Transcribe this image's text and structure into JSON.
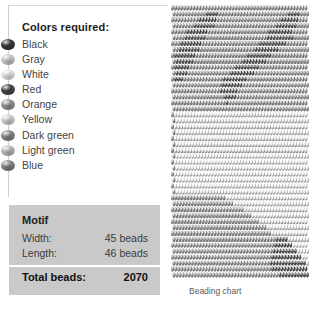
{
  "legend": {
    "title": "Colors required:",
    "items": [
      {
        "label": "Black",
        "swatch": "#3b3b3b"
      },
      {
        "label": "Gray",
        "swatch": "#d3d3d3"
      },
      {
        "label": "White",
        "swatch": "#f0f0f0"
      },
      {
        "label": "Red",
        "swatch": "#4a4a4a"
      },
      {
        "label": "Orange",
        "swatch": "#9b9b9b"
      },
      {
        "label": "Yellow",
        "swatch": "#dcdcdc"
      },
      {
        "label": "Dark green",
        "swatch": "#8d8d8d"
      },
      {
        "label": "Light green",
        "swatch": "#c4c4c4"
      },
      {
        "label": "Blue",
        "swatch": "#8a8a8a"
      }
    ]
  },
  "motif": {
    "heading": "Motif",
    "width_label": "Width:",
    "width_value": "45 beads",
    "length_label": "Length:",
    "length_value": "46 beads",
    "total_label": "Total beads:",
    "total_value": "2070",
    "box_color": "#c9c9c9"
  },
  "chart": {
    "caption": "Beading chart",
    "columns": 45,
    "rows": 46,
    "style": "brick-offset-rows",
    "palette": [
      "#3b3b3b",
      "#d3d3d3",
      "#f0f0f0",
      "#4a4a4a",
      "#9b9b9b",
      "#dcdcdc",
      "#8d8d8d",
      "#c4c4c4",
      "#8a8a8a"
    ],
    "bead_grid": [
      "888888888888888888888888888888888888888888888",
      "888888888880000888888888888888888888880000888",
      "888888888000000888888888888888888888000000888",
      "888888800000008888888888888888888800000008888",
      "888880000000888888888888888888880000000088888",
      "888800000008888888888888888888800000000088888",
      "888000000088888888888888888880000000008888888",
      "880000000888888888888888888000000008888888888",
      "800000008888888888888888800000000888888888888",
      "800000088888888888888880000000088888888888888",
      "800000888888888888888000000008888888888888888",
      "800008888888888888800000000888888888888888888",
      "800088888888888880000000088888888888888888888",
      "888888888888888800000008888888888888888888888",
      "888888888888888800000088888888888888888888888",
      "888888888888888880000888888888888888888888888",
      "888888888888888888088888888888888888888888888",
      "888888888888888888888888888888888888888888888",
      "822222222222222222222222222222222222222222222",
      "822222222222222222222222222222222222222222222",
      "822222222222222222222222222222222222222222222",
      "822222222222222222222222222222222222222222222",
      "822222222222222222222222222222222222222222222",
      "822222222222222222222222222222222222222222222",
      "822222222222222222222222222222222222222222222",
      "822222222222222222222222222222222222222222222",
      "822222222222222222222222222222222222222222222",
      "822222222222222222222222222222222222222222222",
      "822222222222222222222222222222222222222222222",
      "822222222222222222222222222222222222222222222",
      "822222222222222222222222222222222222222222222",
      "822222222222222222222222222222222222222222222",
      "888888888888888888222222222222222222222222222",
      "888888888888888666662222222222222222222222222",
      "888888888888866666666666222222222222222222222",
      "888888888886666666666666662222222222222222222",
      "888888888666666666666666666662222222222222222",
      "888888866666666666666666666666622222222222222",
      "888886666666666666666666666666666222222222222",
      "666666666666666666666666666666666600002222222",
      "666666666666666666666666666666666600000022222",
      "666666666666666666666666666666666000000002222",
      "666666666666666666666666666666666000000000022",
      "666666666666666666666666666666660000000000002",
      "666666666666666666666666666666666000000000000",
      "666666666666666666666666666666666660000000000"
    ]
  }
}
